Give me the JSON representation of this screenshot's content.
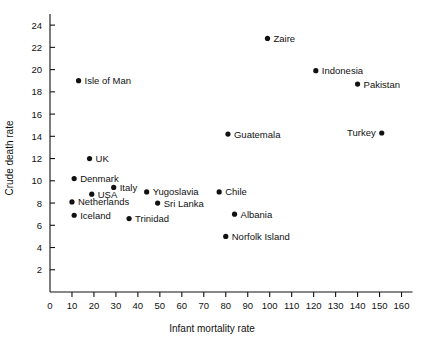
{
  "chart_data": {
    "type": "scatter",
    "title": "",
    "xlabel": "Infant mortality rate",
    "ylabel": "Crude death rate",
    "xlim": [
      0,
      165
    ],
    "ylim": [
      0,
      25
    ],
    "xticks": [
      0,
      10,
      20,
      30,
      40,
      50,
      60,
      70,
      80,
      90,
      100,
      110,
      120,
      130,
      140,
      150,
      160
    ],
    "yticks": [
      2,
      4,
      6,
      8,
      10,
      12,
      14,
      16,
      18,
      20,
      22,
      24
    ],
    "grid": false,
    "legend": "none",
    "marker_color": "#111111",
    "points": [
      {
        "label": "Isle of Man",
        "x": 13,
        "y": 19.0,
        "label_side": "right"
      },
      {
        "label": "UK",
        "x": 18,
        "y": 12.0,
        "label_side": "right"
      },
      {
        "label": "Denmark",
        "x": 11,
        "y": 10.2,
        "label_side": "right"
      },
      {
        "label": "Italy",
        "x": 29,
        "y": 9.4,
        "label_side": "right"
      },
      {
        "label": "USA",
        "x": 19,
        "y": 8.8,
        "label_side": "right"
      },
      {
        "label": "Netherlands",
        "x": 10,
        "y": 8.1,
        "label_side": "right"
      },
      {
        "label": "Iceland",
        "x": 11,
        "y": 6.9,
        "label_side": "right"
      },
      {
        "label": "Trinidad",
        "x": 36,
        "y": 6.6,
        "label_side": "right"
      },
      {
        "label": "Yugoslavia",
        "x": 44,
        "y": 9.0,
        "label_side": "right"
      },
      {
        "label": "Sri Lanka",
        "x": 49,
        "y": 8.0,
        "label_side": "right"
      },
      {
        "label": "Chile",
        "x": 77,
        "y": 9.0,
        "label_side": "right"
      },
      {
        "label": "Albania",
        "x": 84,
        "y": 7.0,
        "label_side": "right"
      },
      {
        "label": "Norfolk Island",
        "x": 80,
        "y": 5.0,
        "label_side": "right"
      },
      {
        "label": "Guatemala",
        "x": 81,
        "y": 14.2,
        "label_side": "right"
      },
      {
        "label": "Zaire",
        "x": 99,
        "y": 22.8,
        "label_side": "right"
      },
      {
        "label": "Indonesia",
        "x": 121,
        "y": 19.9,
        "label_side": "right"
      },
      {
        "label": "Pakistan",
        "x": 140,
        "y": 18.7,
        "label_side": "right"
      },
      {
        "label": "Turkey",
        "x": 151,
        "y": 14.3,
        "label_side": "left"
      }
    ]
  }
}
